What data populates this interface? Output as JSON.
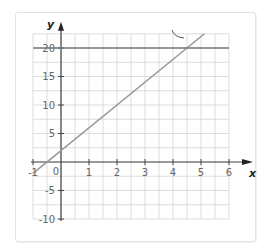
{
  "chart_data": {
    "type": "line",
    "title": "",
    "xlabel": "x",
    "ylabel": "y",
    "xlim": [
      -1,
      6
    ],
    "ylim": [
      -10,
      22.5
    ],
    "x_ticks": [
      "-1",
      "1",
      "2",
      "3",
      "4",
      "5",
      "6"
    ],
    "origin_label": "0",
    "y_ticks": [
      "20",
      "15",
      "10",
      "5",
      "-5",
      "-10"
    ],
    "grid": true,
    "series": [
      {
        "name": "y = 4x + 2",
        "x": [
          -1,
          5.125
        ],
        "y": [
          -2,
          22.5
        ],
        "color": "#9a9a9a"
      },
      {
        "name": "y = 20",
        "x": [
          -1,
          6
        ],
        "y": [
          20,
          20
        ],
        "color": "#777777"
      }
    ],
    "annotations": [
      {
        "type": "curved-pointer",
        "near": [
          4.5,
          22.5
        ]
      }
    ]
  }
}
